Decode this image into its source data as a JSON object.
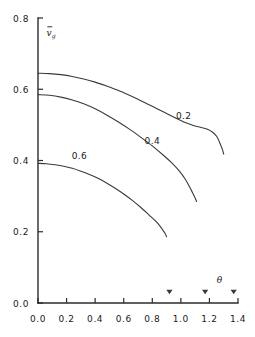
{
  "chart_data": {
    "type": "line",
    "title": "",
    "xlabel": "θ",
    "ylabel": "v̄_g",
    "xlim": [
      0.0,
      1.4
    ],
    "ylim": [
      0.0,
      0.8
    ],
    "grid": false,
    "legend_position": "inline-curve-labels",
    "x_ticks": [
      "0.0",
      "0.2",
      "0.4",
      "0.6",
      "0.8",
      "1.0",
      "1.2",
      "1.4"
    ],
    "x_tick_values": [
      0.0,
      0.2,
      0.4,
      0.6,
      0.8,
      1.0,
      1.2,
      1.4
    ],
    "y_ticks": [
      "0.0",
      "0.2",
      "0.4",
      "0.6",
      "0.8"
    ],
    "y_tick_values": [
      0.0,
      0.2,
      0.4,
      0.6,
      0.8
    ],
    "series": [
      {
        "name": "0.2",
        "label": "0.2",
        "label_x": 1.02,
        "label_y": 0.525,
        "x": [
          0.0,
          0.08,
          0.16,
          0.24,
          0.32,
          0.4,
          0.48,
          0.56,
          0.64,
          0.72,
          0.8,
          0.88,
          0.96,
          1.04,
          1.1,
          1.15,
          1.19,
          1.22,
          1.25,
          1.27,
          1.29,
          1.3
        ],
        "y": [
          0.645,
          0.644,
          0.641,
          0.636,
          0.629,
          0.62,
          0.609,
          0.597,
          0.583,
          0.568,
          0.552,
          0.536,
          0.52,
          0.505,
          0.497,
          0.492,
          0.487,
          0.48,
          0.468,
          0.452,
          0.432,
          0.418
        ]
      },
      {
        "name": "0.4",
        "label": "0.4",
        "label_x": 0.8,
        "label_y": 0.455,
        "x": [
          0.0,
          0.08,
          0.16,
          0.24,
          0.32,
          0.4,
          0.48,
          0.56,
          0.64,
          0.72,
          0.8,
          0.88,
          0.94,
          0.99,
          1.03,
          1.06,
          1.08,
          1.1,
          1.11
        ],
        "y": [
          0.585,
          0.583,
          0.578,
          0.57,
          0.559,
          0.545,
          0.528,
          0.509,
          0.488,
          0.465,
          0.441,
          0.414,
          0.392,
          0.37,
          0.348,
          0.327,
          0.311,
          0.295,
          0.285
        ]
      },
      {
        "name": "0.6",
        "label": "0.6",
        "label_x": 0.29,
        "label_y": 0.415,
        "x": [
          0.0,
          0.06,
          0.12,
          0.18,
          0.24,
          0.3,
          0.36,
          0.42,
          0.48,
          0.54,
          0.6,
          0.66,
          0.72,
          0.78,
          0.82,
          0.85,
          0.87,
          0.89,
          0.9
        ],
        "y": [
          0.392,
          0.391,
          0.388,
          0.384,
          0.378,
          0.37,
          0.361,
          0.35,
          0.337,
          0.322,
          0.306,
          0.288,
          0.268,
          0.246,
          0.231,
          0.218,
          0.207,
          0.195,
          0.186
        ]
      }
    ],
    "axis_markers": [
      {
        "name": "marker-1",
        "x": 0.92,
        "glyph": "▼"
      },
      {
        "name": "marker-2",
        "x": 1.17,
        "glyph": "▼"
      },
      {
        "name": "marker-3",
        "x": 1.37,
        "glyph": "▼"
      }
    ],
    "xlabel_position": {
      "x": 1.27,
      "y": 0.035
    }
  },
  "colors": {
    "axis": "#2b2b2b",
    "curve": "#3a3a3a",
    "text": "#1a1a1a",
    "background": "#ffffff"
  }
}
